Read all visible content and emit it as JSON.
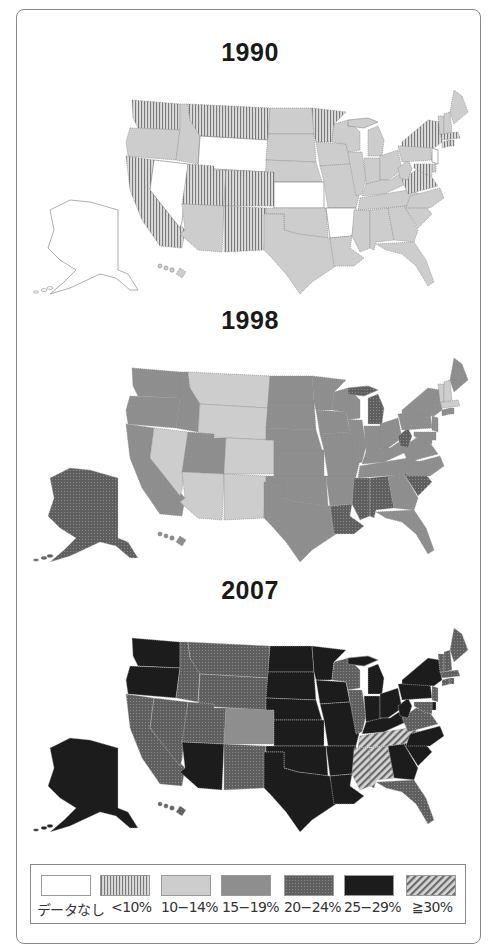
{
  "titles": {
    "y1990": "1990",
    "y1998": "1998",
    "y2007": "2007"
  },
  "legend": {
    "items": [
      {
        "key": "nodata",
        "label": "データなし",
        "color": "#ffffff"
      },
      {
        "key": "lt10",
        "label": "<10%",
        "color": "#c9c9c9"
      },
      {
        "key": "10_14",
        "label": "10−14%",
        "color": "#cfcfcf"
      },
      {
        "key": "15_19",
        "label": "15−19%",
        "color": "#8f8f8f"
      },
      {
        "key": "20_24",
        "label": "20−24%",
        "color": "#6d6d6d"
      },
      {
        "key": "25_29",
        "label": "25−29%",
        "color": "#1e1e1e"
      },
      {
        "key": "ge30",
        "label": "≧30%",
        "color": "#a0a0a0"
      }
    ]
  },
  "chart_data": [
    {
      "type": "choropleth",
      "title": "1990",
      "states": {
        "WA": "lt10",
        "OR": "10_14",
        "CA": "lt10",
        "NV": "nodata",
        "ID": "10_14",
        "MT": "lt10",
        "WY": "nodata",
        "UT": "lt10",
        "CO": "lt10",
        "AZ": "10_14",
        "NM": "lt10",
        "ND": "10_14",
        "SD": "10_14",
        "NE": "10_14",
        "KS": "nodata",
        "OK": "10_14",
        "TX": "10_14",
        "MN": "lt10",
        "IA": "10_14",
        "MO": "10_14",
        "AR": "nodata",
        "LA": "10_14",
        "WI": "10_14",
        "IL": "10_14",
        "MI": "10_14",
        "IN": "10_14",
        "OH": "10_14",
        "KY": "10_14",
        "TN": "10_14",
        "MS": "10_14",
        "AL": "10_14",
        "GA": "10_14",
        "FL": "10_14",
        "SC": "10_14",
        "NC": "10_14",
        "VA": "lt10",
        "WV": "10_14",
        "PA": "10_14",
        "NY": "lt10",
        "NJ": "nodata",
        "DE": "10_14",
        "MD": "lt10",
        "CT": "lt10",
        "RI": "lt10",
        "MA": "lt10",
        "VT": "10_14",
        "NH": "10_14",
        "ME": "10_14",
        "AK": "nodata",
        "HI": "10_14"
      }
    },
    {
      "type": "choropleth",
      "title": "1998",
      "states": {
        "WA": "15_19",
        "OR": "15_19",
        "CA": "15_19",
        "NV": "10_14",
        "ID": "15_19",
        "MT": "10_14",
        "WY": "10_14",
        "UT": "15_19",
        "CO": "10_14",
        "AZ": "10_14",
        "NM": "10_14",
        "ND": "15_19",
        "SD": "15_19",
        "NE": "15_19",
        "KS": "15_19",
        "OK": "15_19",
        "TX": "15_19",
        "MN": "15_19",
        "IA": "15_19",
        "MO": "15_19",
        "AR": "15_19",
        "LA": "20_24",
        "WI": "15_19",
        "IL": "15_19",
        "MI": "20_24",
        "IN": "15_19",
        "OH": "15_19",
        "KY": "15_19",
        "TN": "15_19",
        "MS": "20_24",
        "AL": "20_24",
        "GA": "15_19",
        "FL": "15_19",
        "SC": "20_24",
        "NC": "15_19",
        "VA": "15_19",
        "WV": "20_24",
        "PA": "15_19",
        "NY": "15_19",
        "NJ": "15_19",
        "DE": "15_19",
        "MD": "15_19",
        "CT": "15_19",
        "RI": "15_19",
        "MA": "10_14",
        "VT": "10_14",
        "NH": "10_14",
        "ME": "15_19",
        "AK": "20_24",
        "HI": "15_19"
      }
    },
    {
      "type": "choropleth",
      "title": "2007",
      "states": {
        "WA": "25_29",
        "OR": "25_29",
        "CA": "20_24",
        "NV": "20_24",
        "ID": "20_24",
        "MT": "20_24",
        "WY": "20_24",
        "UT": "20_24",
        "CO": "15_19",
        "AZ": "25_29",
        "NM": "20_24",
        "ND": "25_29",
        "SD": "25_29",
        "NE": "25_29",
        "KS": "25_29",
        "OK": "25_29",
        "TX": "25_29",
        "MN": "25_29",
        "IA": "25_29",
        "MO": "25_29",
        "AR": "25_29",
        "LA": "25_29",
        "WI": "20_24",
        "IL": "20_24",
        "MI": "25_29",
        "IN": "25_29",
        "OH": "25_29",
        "KY": "25_29",
        "TN": "ge30",
        "MS": "ge30",
        "AL": "ge30",
        "GA": "25_29",
        "FL": "20_24",
        "SC": "25_29",
        "NC": "25_29",
        "VA": "20_24",
        "WV": "25_29",
        "PA": "25_29",
        "NY": "25_29",
        "NJ": "20_24",
        "DE": "25_29",
        "MD": "20_24",
        "CT": "20_24",
        "RI": "20_24",
        "MA": "20_24",
        "VT": "20_24",
        "NH": "20_24",
        "ME": "20_24",
        "AK": "25_29",
        "HI": "20_24"
      }
    }
  ]
}
